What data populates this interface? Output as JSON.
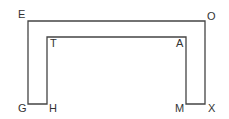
{
  "diagram": {
    "type": "shape-outline",
    "stroke_color": "#444444",
    "vertices": [
      {
        "label": "E",
        "x": 28,
        "y": 21,
        "lx": 18,
        "ly": 18
      },
      {
        "label": "O",
        "x": 205,
        "y": 21,
        "lx": 207,
        "ly": 20
      },
      {
        "label": "X",
        "x": 205,
        "y": 104,
        "lx": 208,
        "ly": 112
      },
      {
        "label": "M",
        "x": 186,
        "y": 104,
        "lx": 175,
        "ly": 112
      },
      {
        "label": "A",
        "x": 186,
        "y": 37,
        "lx": 176,
        "ly": 47
      },
      {
        "label": "T",
        "x": 47,
        "y": 37,
        "lx": 50,
        "ly": 47
      },
      {
        "label": "H",
        "x": 47,
        "y": 104,
        "lx": 49,
        "ly": 112
      },
      {
        "label": "G",
        "x": 28,
        "y": 104,
        "lx": 18,
        "ly": 112
      }
    ],
    "labels": {
      "E": "E",
      "O": "O",
      "X": "X",
      "M": "M",
      "A": "A",
      "T": "T",
      "H": "H",
      "G": "G"
    }
  }
}
